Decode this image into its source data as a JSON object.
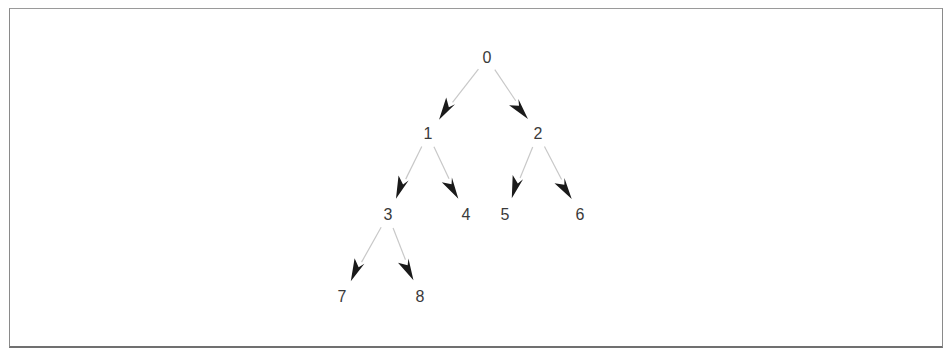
{
  "diagram": {
    "type": "binary-tree",
    "nodes": [
      {
        "id": "0",
        "label": "0",
        "x": 487,
        "y": 58
      },
      {
        "id": "1",
        "label": "1",
        "x": 428,
        "y": 134
      },
      {
        "id": "2",
        "label": "2",
        "x": 538,
        "y": 134
      },
      {
        "id": "3",
        "label": "3",
        "x": 388,
        "y": 215
      },
      {
        "id": "4",
        "label": "4",
        "x": 466,
        "y": 215
      },
      {
        "id": "5",
        "label": "5",
        "x": 505,
        "y": 215
      },
      {
        "id": "6",
        "label": "6",
        "x": 580,
        "y": 215
      },
      {
        "id": "7",
        "label": "7",
        "x": 342,
        "y": 297
      },
      {
        "id": "8",
        "label": "8",
        "x": 420,
        "y": 297
      }
    ],
    "edges": [
      {
        "from": "0",
        "to": "1"
      },
      {
        "from": "0",
        "to": "2"
      },
      {
        "from": "1",
        "to": "3"
      },
      {
        "from": "1",
        "to": "4"
      },
      {
        "from": "2",
        "to": "5"
      },
      {
        "from": "2",
        "to": "6"
      },
      {
        "from": "3",
        "to": "7"
      },
      {
        "from": "3",
        "to": "8"
      }
    ],
    "colors": {
      "edge_line": "#c8c8c8",
      "arrowhead": "#1a1a1a",
      "label": "#3a3a3a",
      "frame": "#8a8a8a"
    }
  }
}
